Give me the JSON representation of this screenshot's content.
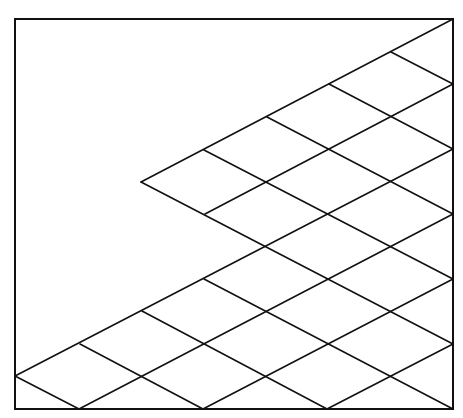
{
  "diagram": {
    "type": "rhombus-lattice",
    "colors": {
      "background": "#ffffff",
      "stroke": "#111111"
    },
    "stroke_width": 1.6,
    "frame": {
      "x1": 15,
      "y1": 19,
      "x2": 453,
      "y2": 409
    },
    "lattice": {
      "origin": [
        453,
        19
      ],
      "half_step_x": 62,
      "half_step_y": 32.5
    },
    "apex": [
      141,
      182
    ],
    "lines": [
      {
        "id": "up-0",
        "x1": 453,
        "y1": 19,
        "x2": 141,
        "y2": 182
      },
      {
        "id": "up-2",
        "x1": 453,
        "y1": 84,
        "x2": 205,
        "y2": 214
      },
      {
        "id": "up-4",
        "x1": 453,
        "y1": 149,
        "x2": 15,
        "y2": 376
      },
      {
        "id": "up-6",
        "x1": 453,
        "y1": 214,
        "x2": 79,
        "y2": 409
      },
      {
        "id": "up-8",
        "x1": 453,
        "y1": 279,
        "x2": 203,
        "y2": 409
      },
      {
        "id": "up-10",
        "x1": 453,
        "y1": 344,
        "x2": 327,
        "y2": 409
      },
      {
        "id": "down-2",
        "x1": 391,
        "y1": 52,
        "x2": 453,
        "y2": 84
      },
      {
        "id": "down-4",
        "x1": 329,
        "y1": 84,
        "x2": 453,
        "y2": 149
      },
      {
        "id": "down-6",
        "x1": 267,
        "y1": 117,
        "x2": 453,
        "y2": 214
      },
      {
        "id": "down-8",
        "x1": 204,
        "y1": 150,
        "x2": 453,
        "y2": 279
      },
      {
        "id": "down-10",
        "x1": 141,
        "y1": 182,
        "x2": 453,
        "y2": 344
      },
      {
        "id": "down-12",
        "x1": 204,
        "y1": 279,
        "x2": 453,
        "y2": 409
      },
      {
        "id": "down-14",
        "x1": 142,
        "y1": 311,
        "x2": 327,
        "y2": 409
      },
      {
        "id": "down-16",
        "x1": 80,
        "y1": 344,
        "x2": 203,
        "y2": 409
      },
      {
        "id": "down-18",
        "x1": 15,
        "y1": 376,
        "x2": 79,
        "y2": 409
      }
    ]
  }
}
